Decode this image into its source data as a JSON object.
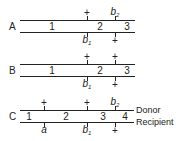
{
  "diagrams": [
    {
      "label": "A",
      "top_marks": [
        {
          "text": "+",
          "x": 87
        },
        {
          "text": "b",
          "sub": "2",
          "x": 115
        }
      ],
      "segments": [
        {
          "text": "1",
          "x": 52
        },
        {
          "text": "2",
          "x": 100
        },
        {
          "text": "3",
          "x": 127
        }
      ],
      "bottom_marks": [
        {
          "text": "b",
          "sub": "1",
          "x": 87
        },
        {
          "text": "+",
          "x": 115
        }
      ]
    },
    {
      "label": "B",
      "top_marks": [
        {
          "text": "+",
          "x": 87
        },
        {
          "text": "+",
          "x": 115
        }
      ],
      "segments": [
        {
          "text": "1",
          "x": 52
        },
        {
          "text": "2",
          "x": 100
        },
        {
          "text": "3",
          "x": 127
        }
      ],
      "bottom_marks": [
        {
          "text": "b",
          "sub": "1",
          "x": 87
        },
        {
          "text": "+",
          "x": 115
        }
      ]
    },
    {
      "label": "C",
      "top_marks": [
        {
          "text": "+",
          "x": 44
        },
        {
          "text": "+",
          "x": 87
        },
        {
          "text": "b",
          "sub": "2",
          "x": 115
        }
      ],
      "segments": [
        {
          "text": "1",
          "x": 29
        },
        {
          "text": "2",
          "x": 66
        },
        {
          "text": "3",
          "x": 103
        },
        {
          "text": "4",
          "x": 125
        }
      ],
      "bottom_marks": [
        {
          "text": "a",
          "x": 44
        },
        {
          "text": "b",
          "sub": "1",
          "x": 87
        },
        {
          "text": "+",
          "x": 115
        }
      ],
      "top_side_label": "Donor",
      "bottom_side_label": "Recipient"
    }
  ],
  "labels": {
    "A": "A",
    "B": "B",
    "C": "C",
    "plus": "+",
    "b": "b",
    "sub1": "1",
    "sub2": "2",
    "a": "a",
    "seg1": "1",
    "seg2": "2",
    "seg3": "3",
    "seg4": "4",
    "donor": "Donor",
    "recipient": "Recipient"
  }
}
